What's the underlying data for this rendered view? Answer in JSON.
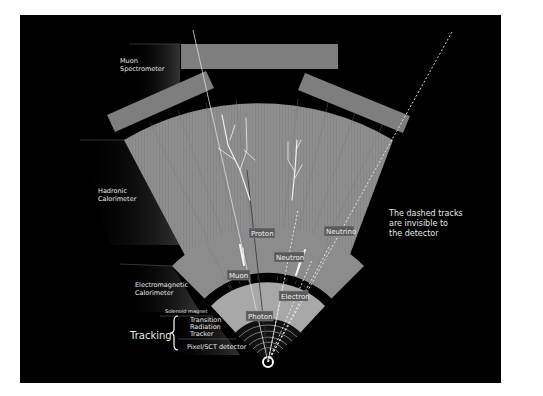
{
  "diagram": {
    "colors": {
      "background": "#000000",
      "page": "#ffffff",
      "detector_gray": "#8c8c8c",
      "tracker_light": "#a8a8a8",
      "muon_chamber": "#7e7e7e",
      "label_box": "#5a5a5a",
      "text": "#e8e8e8"
    },
    "layers": [
      {
        "id": "muon",
        "label_line1": "Muon",
        "label_line2": "Spectrometer"
      },
      {
        "id": "hadronic",
        "label_line1": "Hadronic",
        "label_line2": "Calorimeter"
      },
      {
        "id": "em",
        "label_line1": "Electromagnetic",
        "label_line2": "Calorimeter"
      },
      {
        "id": "solenoid",
        "label": "Solenoid magnet"
      },
      {
        "id": "trt",
        "label_line1": "Transition",
        "label_line2": "Radiation",
        "label_line3": "Tracker"
      },
      {
        "id": "pixel",
        "label": "Pixel/SCT detector"
      }
    ],
    "tracking_group": {
      "label": "Tracking"
    },
    "particles": [
      {
        "name": "Proton",
        "track": "solid"
      },
      {
        "name": "Neutrino",
        "track": "dashed"
      },
      {
        "name": "Neutron",
        "track": "dashed"
      },
      {
        "name": "Muon",
        "track": "solid"
      },
      {
        "name": "Electron",
        "track": "solid"
      },
      {
        "name": "Photon",
        "track": "dashed"
      }
    ],
    "note": {
      "line1": "The dashed tracks",
      "line2": "are invisible to",
      "line3": "the detector"
    }
  }
}
